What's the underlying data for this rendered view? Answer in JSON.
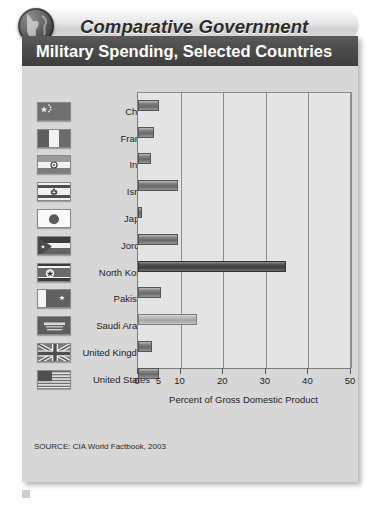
{
  "banner": {
    "title": "Comparative Government",
    "globe_icon": "globe-icon"
  },
  "card": {
    "title": "Military Spending, Selected Countries",
    "source": "SOURCE: CIA World Factbook, 2003"
  },
  "caption": {
    "text": ""
  },
  "chart_data": {
    "type": "bar",
    "orientation": "horizontal",
    "title": "Military Spending, Selected Countries",
    "xlabel": "Percent of Gross Domestic Product",
    "ylabel": "",
    "xlim": [
      0,
      50
    ],
    "xticks": [
      0,
      5,
      10,
      20,
      30,
      40,
      50
    ],
    "xtick_labels": [
      "0",
      "5",
      "10",
      "20",
      "30",
      "40",
      "50"
    ],
    "gridlines": [
      10,
      20,
      30,
      40,
      50
    ],
    "grid": true,
    "legend": "none",
    "source": "SOURCE: CIA World Factbook, 2003",
    "categories": [
      "China",
      "France",
      "India",
      "Israel",
      "Japan",
      "Jordan",
      "North Korea",
      "Pakistan",
      "Saudi Arabia",
      "United Kingdom",
      "United States"
    ],
    "values": [
      4.9,
      3.7,
      3.1,
      9.4,
      1.0,
      9.3,
      34.7,
      5.4,
      13.8,
      3.3,
      4.9
    ],
    "flag_icons": [
      "flag-china-icon",
      "flag-france-icon",
      "flag-india-icon",
      "flag-israel-icon",
      "flag-japan-icon",
      "flag-jordan-icon",
      "flag-north-korea-icon",
      "flag-pakistan-icon",
      "flag-saudi-arabia-icon",
      "flag-united-kingdom-icon",
      "flag-united-states-icon"
    ]
  },
  "colors": {
    "card_background": "#d7d7d7",
    "title_bar": "#4a4a4a",
    "plot_background": "#e4e4e4",
    "gridline": "#8d8d8d",
    "bar_default": "#6a6a6a",
    "bar_dark": "#3f3f3f",
    "bar_light": "#b3b3b3"
  }
}
